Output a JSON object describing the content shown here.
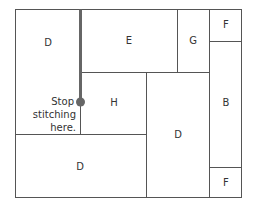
{
  "diagram": {
    "blocks": [
      {
        "id": "block-d-top-left",
        "label": "D"
      },
      {
        "id": "block-e",
        "label": "E"
      },
      {
        "id": "block-g",
        "label": "G"
      },
      {
        "id": "block-f-top",
        "label": "F"
      },
      {
        "id": "block-h",
        "label": "H"
      },
      {
        "id": "block-b",
        "label": "B"
      },
      {
        "id": "block-d-center",
        "label": "D"
      },
      {
        "id": "block-d-bottom-left",
        "label": "D"
      },
      {
        "id": "block-f-bottom",
        "label": "F"
      }
    ],
    "annotation": {
      "line1": "Stop",
      "line2": "stitching",
      "line3": "here."
    },
    "colors": {
      "line": "#555555",
      "seam": "#666666",
      "marker": "#666666"
    }
  }
}
